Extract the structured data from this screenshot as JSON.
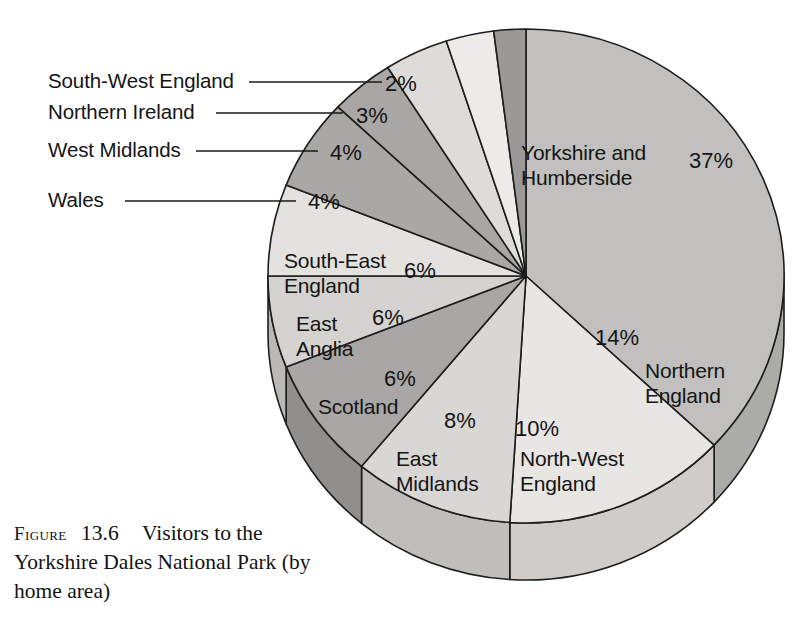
{
  "caption": {
    "figure_word": "Figure",
    "figure_number": "13.6",
    "text": "Visitors to the Yorkshire Dales National Park (by home area)"
  },
  "chart_data": {
    "type": "pie",
    "title": "Visitors to the Yorkshire Dales National Park (by home area)",
    "units": "percent",
    "total": 100,
    "start_angle_deg": 0,
    "direction": "clockwise",
    "style": "3d-pie",
    "categories": [
      "Yorkshire and Humberside",
      "Northern England",
      "North-West England",
      "East Midlands",
      "Scotland",
      "East Anglia",
      "South-East England",
      "Wales",
      "West Midlands",
      "Northern Ireland",
      "South-West England"
    ],
    "values": [
      37,
      14,
      10,
      8,
      6,
      6,
      6,
      4,
      4,
      3,
      2
    ],
    "slices": [
      {
        "label": "Yorkshire and Humberside",
        "label_line1": "Yorkshire and",
        "label_line2": "Humberside",
        "percent": "37%",
        "value": 37,
        "color": "#c2c0be",
        "side_color": "#ababa8",
        "label_placement": "inside",
        "label_x": 521,
        "label_y": 160,
        "pct_x": 689,
        "pct_y": 168
      },
      {
        "label": "Northern England",
        "label_line1": "Northern",
        "label_line2": "England",
        "percent": "14%",
        "value": 14,
        "color": "#e8e6e3",
        "side_color": "#cfccc9",
        "label_placement": "inside",
        "label_x": 645,
        "label_y": 378,
        "pct_x": 595,
        "pct_y": 345
      },
      {
        "label": "North-West England",
        "label_line1": "North-West",
        "label_line2": "England",
        "percent": "10%",
        "value": 10,
        "color": "#d9d7d4",
        "side_color": "#c0bebb",
        "label_placement": "inside",
        "label_x": 520,
        "label_y": 466,
        "pct_x": 515,
        "pct_y": 436
      },
      {
        "label": "East Midlands",
        "label_line1": "East",
        "label_line2": "Midlands",
        "percent": "8%",
        "value": 8,
        "color": "#a9a7a5",
        "side_color": "#918f8d",
        "label_placement": "inside",
        "label_x": 396,
        "label_y": 466,
        "pct_x": 444,
        "pct_y": 428
      },
      {
        "label": "Scotland",
        "label_line1": "Scotland",
        "label_line2": "",
        "percent": "6%",
        "value": 6,
        "color": "#d5d3d0",
        "side_color": "#bbb9b6",
        "label_placement": "inside",
        "label_x": 318,
        "label_y": 414,
        "pct_x": 384,
        "pct_y": 386
      },
      {
        "label": "East Anglia",
        "label_line1": "East",
        "label_line2": "Anglia",
        "percent": "6%",
        "value": 6,
        "color": "#e4e2df",
        "side_color": "#cac8c5",
        "label_placement": "inside",
        "label_x": 296,
        "label_y": 331,
        "pct_x": 372,
        "pct_y": 325
      },
      {
        "label": "South-East England",
        "label_line1": "South-East",
        "label_line2": "England",
        "percent": "6%",
        "value": 6,
        "color": "#aaa8a6",
        "side_color": "#929090",
        "label_placement": "inside",
        "label_x": 284,
        "label_y": 268,
        "pct_x": 404,
        "pct_y": 278
      },
      {
        "label": "Wales",
        "label_line1": "Wales",
        "label_line2": "",
        "percent": "4%",
        "value": 4,
        "color": "#a9a7a5",
        "side_color": "#919090",
        "label_placement": "callout",
        "callout_text_x": 48,
        "callout_text_y": 207,
        "callout_line_x1": 125,
        "callout_line_y1": 201,
        "callout_line_x2": 296,
        "callout_line_y2": 201,
        "pct_x": 308,
        "pct_y": 209
      },
      {
        "label": "West Midlands",
        "label_line1": "West Midlands",
        "label_line2": "",
        "percent": "4%",
        "value": 4,
        "color": "#dedcd9",
        "side_color": "#c4c2bf",
        "label_placement": "callout",
        "callout_text_x": 48,
        "callout_text_y": 157,
        "callout_line_x1": 196,
        "callout_line_y1": 151,
        "callout_line_x2": 318,
        "callout_line_y2": 151,
        "pct_x": 330,
        "pct_y": 160
      },
      {
        "label": "Northern Ireland",
        "label_line1": "Northern Ireland",
        "label_line2": "",
        "percent": "3%",
        "value": 3,
        "color": "#ecebe8",
        "side_color": "#d2d0cd",
        "label_placement": "callout",
        "callout_text_x": 48,
        "callout_text_y": 119,
        "callout_line_x1": 216,
        "callout_line_y1": 113,
        "callout_line_x2": 343,
        "callout_line_y2": 113,
        "pct_x": 356,
        "pct_y": 123
      },
      {
        "label": "South-West England",
        "label_line1": "South-West England",
        "label_line2": "",
        "percent": "2%",
        "value": 2,
        "color": "#9b9997",
        "side_color": "#848282",
        "label_placement": "callout",
        "callout_text_x": 48,
        "callout_text_y": 88,
        "callout_line_x1": 249,
        "callout_line_y1": 82,
        "callout_line_x2": 382,
        "callout_line_y2": 82,
        "pct_x": 385,
        "pct_y": 91
      }
    ],
    "xlabel": "",
    "ylabel": "",
    "legend_position": "none",
    "grid": false
  }
}
